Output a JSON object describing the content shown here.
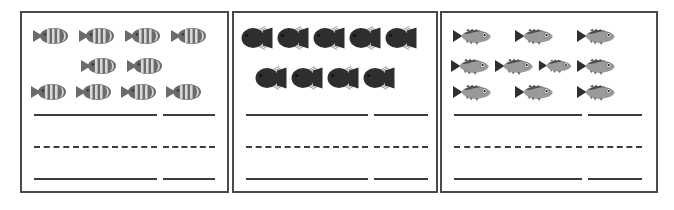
{
  "worksheet": {
    "title": "Fish counting worksheet",
    "panel_count": 3,
    "border_color": "#4a4a4a",
    "line_color": "#3d3d3d",
    "background_color": "#ffffff"
  },
  "panels": [
    {
      "id": "panel-1",
      "fish_type": "striped-fish",
      "fish_color": "#6b6b6b",
      "fish_stripe_color": "#d8d8d8",
      "fish_total": 10,
      "rows": [
        {
          "count": 4,
          "offset_left": 10,
          "gap": 8,
          "scale": 1.0
        },
        {
          "count": 2,
          "offset_left": 58,
          "gap": 8,
          "scale": 1.0
        },
        {
          "count": 4,
          "offset_left": 8,
          "gap": 7,
          "scale": 1.0
        }
      ],
      "lines": {
        "top": {
          "style": "solid",
          "long_width": 123,
          "gap_width": 6,
          "short_width": 52
        },
        "middle": {
          "style": "dashed",
          "long_width": 123,
          "gap_width": 6,
          "short_width": 52
        },
        "bottom": {
          "style": "solid",
          "long_width": 123,
          "gap_width": 6,
          "short_width": 52
        }
      }
    },
    {
      "id": "panel-2",
      "fish_type": "black-fish",
      "fish_color": "#2e2e2e",
      "fish_fin_color": "#8c8c8c",
      "fish_total": 9,
      "rows": [
        {
          "count": 5,
          "offset_left": 6,
          "gap": 2,
          "scale": 1.0
        },
        {
          "count": 4,
          "offset_left": 20,
          "gap": 2,
          "scale": 1.0
        }
      ],
      "lines": {
        "top": {
          "style": "solid",
          "long_width": 122,
          "gap_width": 6,
          "short_width": 54
        },
        "middle": {
          "style": "dashed",
          "long_width": 122,
          "gap_width": 6,
          "short_width": 54
        },
        "bottom": {
          "style": "solid",
          "long_width": 122,
          "gap_width": 6,
          "short_width": 54
        }
      }
    },
    {
      "id": "panel-3",
      "fish_type": "gray-fish",
      "fish_color": "#9a9a9a",
      "fish_back_color": "#4d4d4d",
      "fish_total": 10,
      "rows": [
        {
          "count": 3,
          "offset_left": 10,
          "gap": 22,
          "scale": 1.0
        },
        {
          "count": 4,
          "offset_left": 8,
          "gap": 4,
          "scale": 1.0
        },
        {
          "count": 3,
          "offset_left": 10,
          "gap": 22,
          "scale": 1.0
        }
      ],
      "lines": {
        "top": {
          "style": "solid",
          "long_width": 128,
          "gap_width": 6,
          "short_width": 54
        },
        "middle": {
          "style": "dashed",
          "long_width": 128,
          "gap_width": 6,
          "short_width": 54
        },
        "bottom": {
          "style": "solid",
          "long_width": 128,
          "gap_width": 6,
          "short_width": 54
        }
      }
    }
  ]
}
